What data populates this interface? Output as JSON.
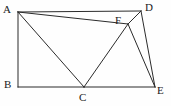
{
  "figure": {
    "type": "geometry-diagram",
    "background_color": "#fefefe",
    "stroke_color": "#2b2b2b",
    "label_color": "#1a1a1a",
    "stroke_width": 1,
    "canvas": {
      "width": 171,
      "height": 106
    },
    "points": [
      {
        "id": "A",
        "label": "A",
        "x": 18,
        "y": 12,
        "label_x": 3,
        "label_y": 4
      },
      {
        "id": "B",
        "label": "B",
        "x": 18,
        "y": 87,
        "label_x": 4,
        "label_y": 79
      },
      {
        "id": "C",
        "label": "C",
        "x": 84,
        "y": 87,
        "label_x": 79,
        "label_y": 92
      },
      {
        "id": "D",
        "label": "D",
        "x": 141,
        "y": 11,
        "label_x": 145,
        "label_y": 2
      },
      {
        "id": "E",
        "label": "E",
        "x": 155,
        "y": 87,
        "label_x": 157,
        "label_y": 85
      },
      {
        "id": "F",
        "label": "F",
        "x": 128,
        "y": 24,
        "label_x": 115,
        "label_y": 15
      }
    ],
    "segments": [
      {
        "name": "segment-AB",
        "from": "A",
        "to": "B"
      },
      {
        "name": "segment-BC",
        "from": "B",
        "to": "C"
      },
      {
        "name": "segment-CE",
        "from": "C",
        "to": "E"
      },
      {
        "name": "segment-AD",
        "from": "A",
        "to": "D"
      },
      {
        "name": "segment-AC",
        "from": "A",
        "to": "C"
      },
      {
        "name": "segment-AF",
        "from": "A",
        "to": "F"
      },
      {
        "name": "segment-FD",
        "from": "F",
        "to": "D"
      },
      {
        "name": "segment-CF",
        "from": "C",
        "to": "F"
      },
      {
        "name": "segment-FE",
        "from": "F",
        "to": "E"
      },
      {
        "name": "segment-DE",
        "from": "D",
        "to": "E"
      }
    ]
  }
}
